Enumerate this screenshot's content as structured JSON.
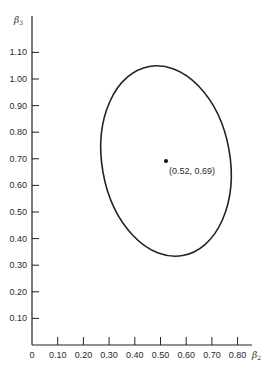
{
  "chart_data": {
    "type": "scatter",
    "title": "",
    "xlabel": "β2",
    "ylabel": "β3",
    "xlim": [
      0,
      0.85
    ],
    "ylim": [
      0,
      1.18
    ],
    "grid": false,
    "x_ticks": [
      "0",
      "0.10",
      "0.20",
      "0.30",
      "0.40",
      "0.50",
      "0.60",
      "0.70",
      "0.80"
    ],
    "y_ticks": [
      "0.10",
      "0.20",
      "0.30",
      "0.40",
      "0.50",
      "0.60",
      "0.70",
      "0.80",
      "0.90",
      "1.00",
      "1.10"
    ],
    "series": [
      {
        "name": "confidence ellipse",
        "kind": "ellipse",
        "center": [
          0.52,
          0.69
        ],
        "extents": {
          "left": [
            0.265,
            0.71
          ],
          "right": [
            0.775,
            0.65
          ],
          "top": [
            0.48,
            1.05
          ],
          "bottom": [
            0.55,
            0.33
          ]
        }
      },
      {
        "name": "point estimate",
        "kind": "point",
        "x": [
          0.52
        ],
        "y": [
          0.69
        ]
      }
    ],
    "annotations": [
      {
        "text": "(0.52, 0.69)",
        "x": 0.52,
        "y": 0.69
      }
    ]
  },
  "labels": {
    "x_axis_symbol": "β",
    "x_axis_sub": "2",
    "y_axis_symbol": "β",
    "y_axis_sub": "3",
    "point_label": "(0.52, 0.69)"
  }
}
